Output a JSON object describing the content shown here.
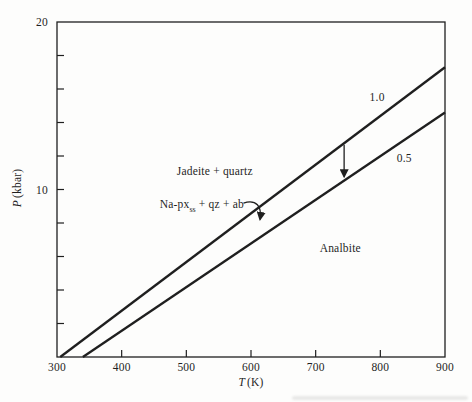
{
  "figure": {
    "background": "#fdfdfc",
    "ink": "#1f1f1f"
  },
  "chart_data": {
    "type": "line",
    "title": "",
    "xlabel_var": "T",
    "xlabel_unit": "(K)",
    "ylabel_var": "P",
    "ylabel_unit": "(kbar)",
    "x_axis": {
      "min": 300,
      "max": 900,
      "tick_step": 100,
      "tick_labels": [
        "300",
        "400",
        "500",
        "600",
        "700",
        "800",
        "900"
      ]
    },
    "y_axis": {
      "min": 0,
      "max": 20,
      "tick_step": 2,
      "labeled_ticks": [
        {
          "value": 10,
          "label": "10"
        },
        {
          "value": 20,
          "label": "20"
        }
      ]
    },
    "series": [
      {
        "name": "1.0",
        "points": [
          [
            305,
            0
          ],
          [
            900,
            17.3
          ]
        ],
        "label_pos": {
          "T": 795,
          "P": 15.5
        }
      },
      {
        "name": "0.5",
        "points": [
          [
            340,
            0
          ],
          [
            900,
            14.6
          ]
        ],
        "label_pos": {
          "T": 837,
          "P": 11.9
        }
      }
    ],
    "region_labels": [
      {
        "text": "Jadeite + quartz",
        "T": 544,
        "P": 11.1
      },
      {
        "parts": [
          "Na-px",
          "ss",
          " + qz + ab"
        ],
        "T": 524,
        "P": 9.0
      },
      {
        "text": "Analbite",
        "T": 738,
        "P": 6.5
      }
    ],
    "annotations": [
      {
        "type": "vertical-arrow",
        "T": 744,
        "from_series": 0,
        "to_series": 1
      },
      {
        "type": "curved-arrow",
        "from": {
          "T": 593,
          "P": 9.25
        },
        "to": {
          "T": 614,
          "P": 8.1
        }
      }
    ]
  }
}
